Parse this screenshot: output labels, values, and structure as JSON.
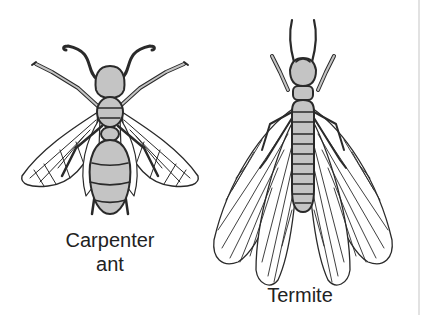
{
  "figure": {
    "panels": [
      {
        "id": "carpenter-ant",
        "label_line1": "Carpenter",
        "label_line2": "ant"
      },
      {
        "id": "termite",
        "label_line1": "Termite"
      }
    ],
    "colors": {
      "body_fill": "#c4c4c4",
      "outline": "#2a2a2a",
      "background": "#ffffff",
      "label": "#222222"
    }
  }
}
